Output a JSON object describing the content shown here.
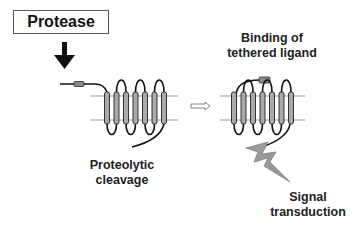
{
  "diagram": {
    "protease_label": "Protease",
    "binding_label_line1": "Binding of",
    "binding_label_line2": "tethered ligand",
    "cleavage_label_line1": "Proteolytic",
    "cleavage_label_line2": "cleavage",
    "signal_label_line1": "Signal",
    "signal_label_line2": "transduction",
    "colors": {
      "membrane_line": "#999999",
      "helix_fill": "#aaaaaa",
      "helix_stroke": "#222222",
      "loop_stroke": "#111111",
      "ligand_fill": "#888888",
      "lightning_fill": "#9a9a9a",
      "arrow_fill": "#111111"
    },
    "icons": {
      "down_arrow": "protease-arrow-icon",
      "transition_arrow": "hollow-right-arrow-icon",
      "lightning": "lightning-bolt-icon"
    }
  }
}
